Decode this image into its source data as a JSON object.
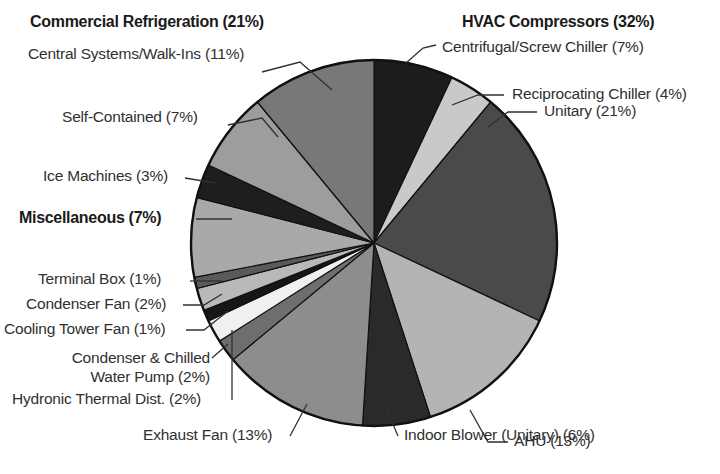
{
  "chart_data": {
    "type": "pie",
    "title": "",
    "legend_position": "callout-labels",
    "total_percent": 100,
    "groups": [
      {
        "name": "HVAC Compressors",
        "percent": 32,
        "bold": true
      },
      {
        "name": "Commercial Refrigeration",
        "percent": 21,
        "bold": true
      },
      {
        "name": "Miscellaneous",
        "percent": 7,
        "bold": true
      }
    ],
    "categories": [
      "Centrifugal/Screw Chiller",
      "Reciprocating Chiller",
      "Unitary",
      "AHU",
      "Indoor Blower (Unitary)",
      "Exhaust Fan",
      "Hydronic Thermal Dist.",
      "Condenser & Chilled Water Pump",
      "Cooling Tower Fan",
      "Condenser Fan",
      "Terminal Box",
      "Miscellaneous",
      "Ice Machines",
      "Self-Contained",
      "Central Systems/Walk-Ins"
    ],
    "values": [
      7,
      4,
      21,
      13,
      6,
      13,
      2,
      2,
      1,
      2,
      1,
      7,
      3,
      7,
      11
    ],
    "colors": [
      "#1c1c1c",
      "#c9c9c9",
      "#4a4a4a",
      "#b4b4b4",
      "#2a2a2a",
      "#8d8d8d",
      "#6e6e6e",
      "#f0f0f0",
      "#161616",
      "#b9b9b9",
      "#5a5a5a",
      "#a9a9a9",
      "#1e1e1e",
      "#9d9d9d",
      "#787878"
    ],
    "slices": [
      {
        "label": "Centrifugal/Screw Chiller (7%)",
        "name": "Centrifugal/Screw Chiller",
        "percent": 7,
        "color": "#1c1c1c"
      },
      {
        "label": "Reciprocating Chiller (4%)",
        "name": "Reciprocating Chiller",
        "percent": 4,
        "color": "#c9c9c9"
      },
      {
        "label": "Unitary (21%)",
        "name": "Unitary",
        "percent": 21,
        "color": "#4a4a4a"
      },
      {
        "label": "AHU (13%)",
        "name": "AHU",
        "percent": 13,
        "color": "#b4b4b4"
      },
      {
        "label": "Indoor Blower (Unitary) (6%)",
        "name": "Indoor Blower (Unitary)",
        "percent": 6,
        "color": "#2a2a2a"
      },
      {
        "label": "Exhaust Fan (13%)",
        "name": "Exhaust Fan",
        "percent": 13,
        "color": "#8d8d8d"
      },
      {
        "label": "Hydronic Thermal Dist. (2%)",
        "name": "Hydronic Thermal Dist.",
        "percent": 2,
        "color": "#6e6e6e"
      },
      {
        "label": "Condenser & Chilled Water Pump (2%)",
        "name": "Condenser & Chilled Water Pump",
        "percent": 2,
        "color": "#f0f0f0"
      },
      {
        "label": "Cooling Tower Fan (1%)",
        "name": "Cooling Tower Fan",
        "percent": 1,
        "color": "#161616"
      },
      {
        "label": "Condenser Fan (2%)",
        "name": "Condenser Fan",
        "percent": 2,
        "color": "#b9b9b9"
      },
      {
        "label": "Terminal Box (1%)",
        "name": "Terminal Box",
        "percent": 1,
        "color": "#5a5a5a"
      },
      {
        "label": "Miscellaneous (7%)",
        "name": "Miscellaneous",
        "percent": 7,
        "color": "#a9a9a9"
      },
      {
        "label": "Ice Machines (3%)",
        "name": "Ice Machines",
        "percent": 3,
        "color": "#1e1e1e"
      },
      {
        "label": "Self-Contained (7%)",
        "name": "Self-Contained",
        "percent": 7,
        "color": "#9d9d9d"
      },
      {
        "label": "Central Systems/Walk-Ins (11%)",
        "name": "Central Systems/Walk-Ins",
        "percent": 11,
        "color": "#787878"
      }
    ]
  },
  "labels": {
    "hvac_compressors": "HVAC Compressors (32%)",
    "commercial_refrigeration": "Commercial Refrigeration (21%)",
    "central_systems": "Central Systems/Walk-Ins (11%)",
    "self_contained": "Self-Contained (7%)",
    "ice_machines": "Ice Machines (3%)",
    "miscellaneous": "Miscellaneous (7%)",
    "terminal_box": "Terminal Box (1%)",
    "condenser_fan": "Condenser Fan (2%)",
    "cooling_tower_fan": "Cooling Tower Fan (1%)",
    "condenser_chilled_line1": "Condenser & Chilled",
    "condenser_chilled_line2": "Water Pump (2%)",
    "hydronic": "Hydronic Thermal Dist. (2%)",
    "exhaust_fan": "Exhaust Fan (13%)",
    "indoor_blower": "Indoor Blower (Unitary) (6%)",
    "ahu": "AHU (13%)",
    "unitary": "Unitary (21%)",
    "reciprocating_chiller": "Reciprocating Chiller (4%)",
    "centrifugal_chiller": "Centrifugal/Screw Chiller (7%)"
  },
  "style": {
    "pie_outline": "#111111",
    "label_color": "#303030",
    "heading_color": "#1a1a1a",
    "background": "#ffffff"
  }
}
